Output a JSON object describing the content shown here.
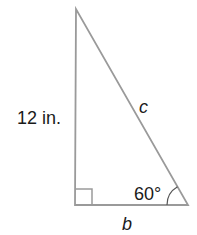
{
  "diagram": {
    "type": "right-triangle",
    "colors": {
      "stroke": "#9a9a9a",
      "text": "#1a1a1a",
      "background": "#ffffff"
    },
    "vertices": {
      "top": [
        76,
        9
      ],
      "right_angle": [
        75,
        205
      ],
      "bottom_right": [
        188,
        205
      ]
    },
    "labels": {
      "vertical_side": "12 in.",
      "hypotenuse": "c",
      "base": "b",
      "angle": "60°"
    },
    "right_angle_marker": true
  }
}
